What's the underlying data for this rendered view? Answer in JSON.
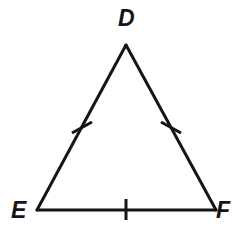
{
  "figure": {
    "kind": "geometry-diagram",
    "shape": "triangle",
    "name": "Triangle DEF",
    "background_color": "#ffffff",
    "stroke_color": "#151515",
    "stroke_width": 3,
    "tick_stroke_width": 3
  },
  "labels": {
    "apex": "D",
    "bottom_left": "E",
    "bottom_right": "F"
  },
  "vertices": [
    {
      "id": "D",
      "label": "D",
      "x": 126,
      "y": 45,
      "label_x": 127,
      "label_y": 19
    },
    {
      "id": "E",
      "label": "E",
      "x": 37,
      "y": 210,
      "label_x": 20,
      "label_y": 211
    },
    {
      "id": "F",
      "label": "F",
      "x": 216,
      "y": 210,
      "label_x": 225,
      "label_y": 211
    }
  ],
  "sides": [
    {
      "id": "DE",
      "from": "D",
      "to": "E",
      "x1": 126,
      "y1": 45,
      "x2": 37,
      "y2": 210,
      "tick_marks": 1
    },
    {
      "id": "DF",
      "from": "D",
      "to": "F",
      "x1": 126,
      "y1": 45,
      "x2": 216,
      "y2": 210,
      "tick_marks": 1
    },
    {
      "id": "EF",
      "from": "E",
      "to": "F",
      "x1": 37,
      "y1": 210,
      "x2": 216,
      "y2": 210,
      "tick_marks": 1
    }
  ],
  "tick_marks": [
    {
      "id": "tick-DE",
      "side": "DE",
      "cx": 82,
      "cy": 127,
      "x1": 72,
      "y1": 133,
      "x2": 92,
      "y2": 122
    },
    {
      "id": "tick-DF",
      "side": "DF",
      "cx": 171,
      "cy": 127,
      "x1": 161,
      "y1": 122,
      "x2": 181,
      "y2": 133
    },
    {
      "id": "tick-EF",
      "side": "EF",
      "cx": 126,
      "cy": 209,
      "x1": 126,
      "y1": 199,
      "x2": 126,
      "y2": 220
    }
  ]
}
